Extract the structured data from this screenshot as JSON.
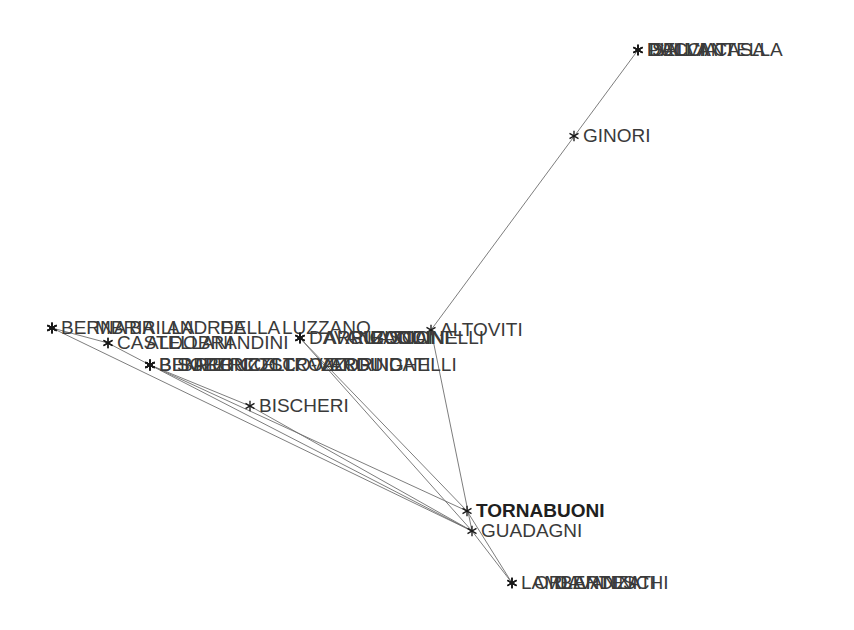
{
  "figure": {
    "background_color": "#ffffff",
    "edge_color": "#6e6e6e",
    "node_marker_color": "#1a1a1a",
    "label_color": "#3a3a3a",
    "node_marker_glyph": "asterisk",
    "width": 854,
    "height": 630
  },
  "chart_data": {
    "type": "scatter",
    "title": "",
    "xlabel": "",
    "ylabel": "",
    "grid": false,
    "legend": "none",
    "axes_visible": false,
    "xlim": [
      0,
      854
    ],
    "ylim": [
      0,
      630
    ],
    "nodes": [
      {
        "id": "DALLANTELLA",
        "label": "DALL'ANTELLA",
        "x": 638,
        "y": 50,
        "label_dx": 9,
        "label_dy": 0,
        "bold": false
      },
      {
        "id": "PUCCI",
        "label": "PUCCI",
        "x": 638,
        "y": 50,
        "label_dx": 9,
        "label_dy": 0,
        "bold": false
      },
      {
        "id": "SALVIATI",
        "label": "SALVIATI",
        "x": 638,
        "y": 50,
        "label_dx": 14,
        "label_dy": 0,
        "bold": false
      },
      {
        "id": "DELLACASA",
        "label": "DELLA CASA",
        "x": 638,
        "y": 50,
        "label_dx": 11,
        "label_dy": 0,
        "bold": false
      },
      {
        "id": "GINORI",
        "label": "GINORI",
        "x": 574,
        "y": 136,
        "label_dx": 9,
        "label_dy": 0,
        "bold": false
      },
      {
        "id": "ALTOVITI",
        "label": "ALTOVITI",
        "x": 431,
        "y": 330,
        "label_dx": 9,
        "label_dy": 0,
        "bold": false
      },
      {
        "id": "BERNA",
        "label": "BERNA",
        "x": 52,
        "y": 328,
        "label_dx": 9,
        "label_dy": 0,
        "bold": false
      },
      {
        "id": "MBRIA",
        "label": "MBRIA",
        "x": 52,
        "y": 328,
        "label_dx": 43,
        "label_dy": 0,
        "bold": false
      },
      {
        "id": "BRILLA",
        "label": "BRILLA",
        "x": 52,
        "y": 328,
        "label_dx": 77,
        "label_dy": 0,
        "bold": false
      },
      {
        "id": "ANDREA",
        "label": "ANDREA",
        "x": 52,
        "y": 328,
        "label_dx": 115,
        "label_dy": 0,
        "bold": false
      },
      {
        "id": "DELLA",
        "label": "DELLA",
        "x": 52,
        "y": 328,
        "label_dx": 168,
        "label_dy": 0,
        "bold": false
      },
      {
        "id": "LUZZANO",
        "label": "LUZZANO",
        "x": 52,
        "y": 328,
        "label_dx": 230,
        "label_dy": 0,
        "bold": false
      },
      {
        "id": "CASTELLANI",
        "label": "CASTELLANI",
        "x": 108,
        "y": 343,
        "label_dx": 9,
        "label_dy": 0,
        "bold": false
      },
      {
        "id": "ALDOBRANDINI",
        "label": "ALDOBRANDINI",
        "x": 108,
        "y": 343,
        "label_dx": 38,
        "label_dy": 0,
        "bold": false
      },
      {
        "id": "DAVANZATI",
        "label": "DAVANZATI",
        "x": 300,
        "y": 338,
        "label_dx": 9,
        "label_dy": 0,
        "bold": false
      },
      {
        "id": "ARRIGUCCI",
        "label": "ARRIGUCCI",
        "x": 300,
        "y": 338,
        "label_dx": 24,
        "label_dy": 0,
        "bold": false
      },
      {
        "id": "GUASCONI",
        "label": "GUASCONI",
        "x": 300,
        "y": 338,
        "label_dx": 48,
        "label_dy": 0,
        "bold": false
      },
      {
        "id": "CIAI",
        "label": "CIAI",
        "x": 300,
        "y": 338,
        "label_dx": 96,
        "label_dy": 0,
        "bold": false
      },
      {
        "id": "RONDINELLI",
        "label": "RONDINELLI",
        "x": 300,
        "y": 338,
        "label_dx": 70,
        "label_dy": 0,
        "bold": false
      },
      {
        "id": "BENIZZI",
        "label": "BENIZZI",
        "x": 150,
        "y": 365,
        "label_dx": 9,
        "label_dy": 0,
        "bold": false
      },
      {
        "id": "BISCHERI2",
        "label": "BISCHERI",
        "x": 150,
        "y": 365,
        "label_dx": 9,
        "label_dy": 0,
        "bold": false
      },
      {
        "id": "PERUZZI",
        "label": "PERUZZI",
        "x": 150,
        "y": 365,
        "label_dx": 45,
        "label_dy": 0,
        "bold": false
      },
      {
        "id": "BARONCELLI",
        "label": "BARONCELLI",
        "x": 150,
        "y": 365,
        "label_dx": 30,
        "label_dy": 0,
        "bold": false
      },
      {
        "id": "COCCOVERI",
        "label": "COCCO-VERI",
        "x": 150,
        "y": 365,
        "label_dx": 90,
        "label_dy": 0,
        "bold": false
      },
      {
        "id": "STROZZI",
        "label": "STROZZI",
        "x": 150,
        "y": 365,
        "label_dx": 120,
        "label_dy": 0,
        "bold": false
      },
      {
        "id": "VALORI",
        "label": "VALORI",
        "x": 150,
        "y": 365,
        "label_dx": 160,
        "label_dy": 0,
        "bold": false
      },
      {
        "id": "GUIDATI",
        "label": "GUIDATI",
        "x": 150,
        "y": 365,
        "label_dx": 205,
        "label_dy": 0,
        "bold": false
      },
      {
        "id": "ARDINGHELLI",
        "label": "ARDINGHELLI",
        "x": 150,
        "y": 365,
        "label_dx": 180,
        "label_dy": 0,
        "bold": false
      },
      {
        "id": "BISCHERI",
        "label": "BISCHERI",
        "x": 250,
        "y": 406,
        "label_dx": 9,
        "label_dy": 0,
        "bold": false
      },
      {
        "id": "TORNABUONI",
        "label": "TORNABUONI",
        "x": 467,
        "y": 511,
        "label_dx": 9,
        "label_dy": 0,
        "bold": true
      },
      {
        "id": "GUADAGNI",
        "label": "GUADAGNI",
        "x": 472,
        "y": 531,
        "label_dx": 9,
        "label_dy": 0,
        "bold": false
      },
      {
        "id": "LAMBERTESCHI",
        "label": "LAMBERTESCHI",
        "x": 512,
        "y": 583,
        "label_dx": 9,
        "label_dy": 0,
        "bold": false
      },
      {
        "id": "ORLANDINI",
        "label": "ORLANDINI",
        "x": 512,
        "y": 583,
        "label_dx": 22,
        "label_dy": 0,
        "bold": false
      },
      {
        "id": "DAVANZATI2",
        "label": "DAVANZATI",
        "x": 512,
        "y": 583,
        "label_dx": 42,
        "label_dy": 0,
        "bold": false
      }
    ],
    "edges": [
      {
        "source": "DALLANTELLA",
        "target": "ALTOVITI"
      },
      {
        "source": "ALTOVITI",
        "target": "GUADAGNI"
      },
      {
        "source": "BERNA",
        "target": "CASTELLANI"
      },
      {
        "source": "CASTELLANI",
        "target": "BENIZZI"
      },
      {
        "source": "BENIZZI",
        "target": "BISCHERI"
      },
      {
        "source": "BISCHERI",
        "target": "GUADAGNI"
      },
      {
        "source": "DAVANZATI",
        "target": "TORNABUONI"
      },
      {
        "source": "GUIDATI",
        "target": "TORNABUONI"
      },
      {
        "source": "GUIDATI",
        "target": "GUADAGNI"
      },
      {
        "source": "TORNABUONI",
        "target": "LAMBERTESCHI"
      },
      {
        "source": "GUADAGNI",
        "target": "LAMBERTESCHI"
      },
      {
        "source": "LUZZANO",
        "target": "GUADAGNI"
      },
      {
        "source": "RONDINELLI",
        "target": "GUADAGNI"
      }
    ]
  }
}
